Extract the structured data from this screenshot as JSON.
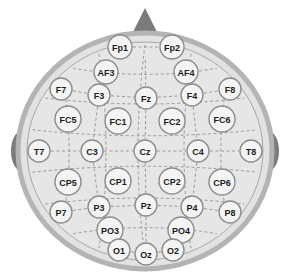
{
  "diagram": {
    "view": "top-down scalp view, nose at top",
    "background_color": "#ffffff"
  },
  "head": {
    "name": "head-outline",
    "cx": 145,
    "cy": 151,
    "rx": 127,
    "ry": 118,
    "fill_color": "#e2e2e2",
    "ring_color": "#b4b4b4",
    "ring_width": 5,
    "inner_fill_color": "#e6e6e6",
    "inner_edge_color": "#a8a8a8"
  },
  "nose": {
    "name": "nose-marker",
    "label": "nose",
    "fill_color": "#7b7b7b",
    "points": "145,8 160,38 130,38"
  },
  "ears": [
    {
      "name": "ear-left",
      "label": "left ear",
      "cx": 22,
      "cy": 151,
      "rx": 11,
      "ry": 20,
      "fill_color": "#7b7b7b"
    },
    {
      "name": "ear-right",
      "label": "right ear",
      "cx": 268,
      "cy": 151,
      "rx": 11,
      "ry": 20,
      "fill_color": "#7b7b7b"
    }
  ],
  "electrode_style": {
    "fill_color": "#f4f4f4",
    "stroke_color": "#8d8d8d",
    "stroke_width": 1.4,
    "text_color": "#1c1c1c",
    "radius_default": 12,
    "font_size_default": 9
  },
  "connector_style": {
    "stroke_color": "#9a9a9a",
    "stroke_width": 1,
    "dash_pattern": "3,2.5"
  },
  "electrodes": [
    {
      "id": "Fp1",
      "label": "Fp1",
      "x": 120,
      "y": 47,
      "r": 12,
      "font_size": 9
    },
    {
      "id": "Fp2",
      "label": "Fp2",
      "x": 172,
      "y": 47,
      "r": 12,
      "font_size": 9
    },
    {
      "id": "AF3",
      "label": "AF3",
      "x": 106,
      "y": 72,
      "r": 12,
      "font_size": 9
    },
    {
      "id": "AF4",
      "label": "AF4",
      "x": 186,
      "y": 72,
      "r": 12,
      "font_size": 9
    },
    {
      "id": "F7",
      "label": "F7",
      "x": 61,
      "y": 89,
      "r": 11,
      "font_size": 9
    },
    {
      "id": "F3",
      "label": "F3",
      "x": 99,
      "y": 95,
      "r": 11,
      "font_size": 9
    },
    {
      "id": "Fz",
      "label": "Fz",
      "x": 146,
      "y": 98,
      "r": 11,
      "font_size": 9
    },
    {
      "id": "F4",
      "label": "F4",
      "x": 192,
      "y": 95,
      "r": 11,
      "font_size": 9
    },
    {
      "id": "F8",
      "label": "F8",
      "x": 230,
      "y": 89,
      "r": 11,
      "font_size": 9
    },
    {
      "id": "FC5",
      "label": "FC5",
      "x": 68,
      "y": 119,
      "r": 13,
      "font_size": 9
    },
    {
      "id": "FC1",
      "label": "FC1",
      "x": 118,
      "y": 121,
      "r": 13,
      "font_size": 9
    },
    {
      "id": "FC2",
      "label": "FC2",
      "x": 172,
      "y": 121,
      "r": 13,
      "font_size": 9
    },
    {
      "id": "FC6",
      "label": "FC6",
      "x": 222,
      "y": 119,
      "r": 13,
      "font_size": 9
    },
    {
      "id": "T7",
      "label": "T7",
      "x": 39,
      "y": 151,
      "r": 11,
      "font_size": 9
    },
    {
      "id": "C3",
      "label": "C3",
      "x": 92,
      "y": 151,
      "r": 11,
      "font_size": 9
    },
    {
      "id": "Cz",
      "label": "Cz",
      "x": 145,
      "y": 151,
      "r": 11,
      "font_size": 9
    },
    {
      "id": "C4",
      "label": "C4",
      "x": 198,
      "y": 151,
      "r": 11,
      "font_size": 9
    },
    {
      "id": "T8",
      "label": "T8",
      "x": 251,
      "y": 151,
      "r": 11,
      "font_size": 9
    },
    {
      "id": "CP5",
      "label": "CP5",
      "x": 68,
      "y": 182,
      "r": 13,
      "font_size": 9
    },
    {
      "id": "CP1",
      "label": "CP1",
      "x": 118,
      "y": 181,
      "r": 13,
      "font_size": 9
    },
    {
      "id": "CP2",
      "label": "CP2",
      "x": 172,
      "y": 181,
      "r": 13,
      "font_size": 9
    },
    {
      "id": "CP6",
      "label": "CP6",
      "x": 222,
      "y": 182,
      "r": 13,
      "font_size": 9
    },
    {
      "id": "P7",
      "label": "P7",
      "x": 61,
      "y": 212,
      "r": 11,
      "font_size": 9
    },
    {
      "id": "P3",
      "label": "P3",
      "x": 99,
      "y": 207,
      "r": 11,
      "font_size": 9
    },
    {
      "id": "Pz",
      "label": "Pz",
      "x": 146,
      "y": 205,
      "r": 11,
      "font_size": 9
    },
    {
      "id": "P4",
      "label": "P4",
      "x": 192,
      "y": 207,
      "r": 11,
      "font_size": 9
    },
    {
      "id": "P8",
      "label": "P8",
      "x": 230,
      "y": 212,
      "r": 11,
      "font_size": 9
    },
    {
      "id": "PO3",
      "label": "PO3",
      "x": 110,
      "y": 230,
      "r": 13,
      "font_size": 9
    },
    {
      "id": "PO4",
      "label": "PO4",
      "x": 181,
      "y": 230,
      "r": 13,
      "font_size": 9
    },
    {
      "id": "O1",
      "label": "O1",
      "x": 119,
      "y": 250,
      "r": 11,
      "font_size": 9
    },
    {
      "id": "Oz",
      "label": "Oz",
      "x": 146,
      "y": 254,
      "r": 11,
      "font_size": 9
    },
    {
      "id": "O2",
      "label": "O2",
      "x": 173,
      "y": 250,
      "r": 11,
      "font_size": 9
    }
  ],
  "connectors": [
    {
      "name": "connector-fp1-fp2",
      "from": "Fp1",
      "to": "Fp2"
    },
    {
      "name": "connector-f7-f3",
      "from": "F7",
      "to": "F3"
    },
    {
      "name": "connector-f3-fz",
      "from": "F3",
      "to": "Fz"
    },
    {
      "name": "connector-fz-f4",
      "from": "Fz",
      "to": "F4"
    },
    {
      "name": "connector-f4-f8",
      "from": "F4",
      "to": "F8"
    },
    {
      "name": "connector-t7-c3",
      "from": "T7",
      "to": "C3"
    },
    {
      "name": "connector-c3-cz",
      "from": "C3",
      "to": "Cz"
    },
    {
      "name": "connector-cz-c4",
      "from": "Cz",
      "to": "C4"
    },
    {
      "name": "connector-c4-t8",
      "from": "C4",
      "to": "T8"
    },
    {
      "name": "connector-p7-p3",
      "from": "P7",
      "to": "P3"
    },
    {
      "name": "connector-p3-pz",
      "from": "P3",
      "to": "Pz"
    },
    {
      "name": "connector-pz-p4",
      "from": "Pz",
      "to": "P4"
    },
    {
      "name": "connector-p4-p8",
      "from": "P4",
      "to": "P8"
    },
    {
      "name": "connector-o1-oz",
      "from": "O1",
      "to": "Oz"
    },
    {
      "name": "connector-oz-o2",
      "from": "Oz",
      "to": "O2"
    },
    {
      "name": "connector-fpz-fz",
      "from": "Fp1",
      "to": "Fz",
      "midline": true
    },
    {
      "name": "connector-fz-cz",
      "from": "Fz",
      "to": "Cz"
    },
    {
      "name": "connector-cz-pz",
      "from": "Cz",
      "to": "Pz"
    },
    {
      "name": "connector-pz-oz",
      "from": "Pz",
      "to": "Oz"
    },
    {
      "name": "connector-f3-c3",
      "from": "F3",
      "to": "C3"
    },
    {
      "name": "connector-c3-p3",
      "from": "C3",
      "to": "P3"
    },
    {
      "name": "connector-f4-c4",
      "from": "F4",
      "to": "C4"
    },
    {
      "name": "connector-c4-p4",
      "from": "C4",
      "to": "P4"
    }
  ],
  "arcs": {
    "name": "scalp-grid-arcs",
    "description": "dashed latitude and longitude arcs of the 10-20 grid",
    "stroke_color": "#9a9a9a"
  }
}
